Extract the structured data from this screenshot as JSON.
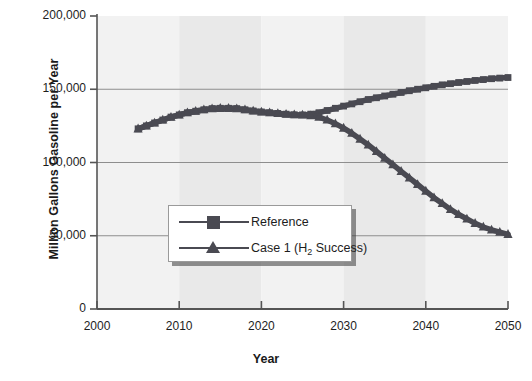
{
  "chart_data": {
    "type": "line",
    "title": "",
    "xlabel": "Year",
    "ylabel": "Million Gallons Gasoline per Year",
    "xlim": [
      2000,
      2050
    ],
    "ylim": [
      0,
      200000
    ],
    "xticks": [
      "2000",
      "2010",
      "2020",
      "2030",
      "2040",
      "2050"
    ],
    "yticks": [
      "0",
      "50,000",
      "100,000",
      "150,000",
      "200,000"
    ],
    "grid": "horizontal",
    "legend_position": "center-left-inside",
    "series_color": "#4a4a52",
    "plot_band_color_a": "#f2f2f2",
    "plot_band_color_b": "#e9e9e9",
    "x": [
      2005,
      2006,
      2007,
      2008,
      2009,
      2010,
      2011,
      2012,
      2013,
      2014,
      2015,
      2016,
      2017,
      2018,
      2019,
      2020,
      2021,
      2022,
      2023,
      2024,
      2025,
      2026,
      2027,
      2028,
      2029,
      2030,
      2031,
      2032,
      2033,
      2034,
      2035,
      2036,
      2037,
      2038,
      2039,
      2040,
      2041,
      2042,
      2043,
      2044,
      2045,
      2046,
      2047,
      2048,
      2049,
      2050
    ],
    "series": [
      {
        "name": "Reference",
        "marker": "square",
        "values": [
          123000,
          125000,
          127000,
          129000,
          131000,
          132500,
          134000,
          135000,
          136000,
          136800,
          137000,
          137000,
          136800,
          136000,
          135200,
          134500,
          134000,
          133500,
          133000,
          132600,
          132500,
          133000,
          134000,
          135500,
          137000,
          138500,
          140000,
          141500,
          143000,
          144200,
          145400,
          146600,
          147800,
          149000,
          150000,
          151000,
          152000,
          153000,
          153800,
          154600,
          155300,
          156000,
          156600,
          157200,
          157600,
          158000
        ]
      },
      {
        "name": "Case 1 (H2 Success)",
        "marker": "triangle",
        "label_html": "Case 1 (H<sub>2</sub> Success)",
        "values": [
          123000,
          125000,
          127000,
          129000,
          131000,
          132500,
          134000,
          135000,
          136000,
          136800,
          137000,
          137000,
          136800,
          136000,
          135200,
          134500,
          134000,
          133500,
          133000,
          132600,
          132500,
          132000,
          131000,
          129000,
          126500,
          123500,
          120000,
          116000,
          112000,
          107500,
          103000,
          98500,
          94000,
          89500,
          85000,
          80500,
          76000,
          72000,
          68000,
          64500,
          61500,
          58500,
          56000,
          54000,
          52500,
          51000
        ]
      }
    ]
  },
  "legend": {
    "items": [
      {
        "label": "Reference"
      },
      {
        "label": "Case 1 (H2 Success)"
      }
    ]
  }
}
